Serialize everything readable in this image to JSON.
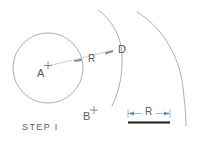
{
  "figure": {
    "caption": "STEP I",
    "labels": {
      "center_point": "A",
      "second_point": "B",
      "intersection_point": "D",
      "radius_dimension": "R",
      "scale_dimension": "R"
    },
    "colors": {
      "arc_stroke": "#9a9a9a",
      "circle_stroke": "#9a9a9a",
      "radius_line": "#b9c3cf",
      "arrow_accent": "#6f8fb5",
      "scale_bar": "#1a1a1a",
      "text": "#555a60",
      "background": "#ffffff"
    },
    "geometry": {
      "circle": {
        "cx": 48,
        "cy": 68,
        "r": 35
      },
      "point_A": {
        "x": 48,
        "y": 66
      },
      "point_B": {
        "x": 94,
        "y": 110
      },
      "point_D": {
        "x": 114,
        "y": 50
      },
      "radius_line": {
        "x1": 48,
        "y1": 66,
        "x2": 114,
        "y2": 50
      },
      "scale_bar": {
        "x1": 128,
        "y1": 122,
        "x2": 170,
        "y2": 122
      }
    }
  }
}
